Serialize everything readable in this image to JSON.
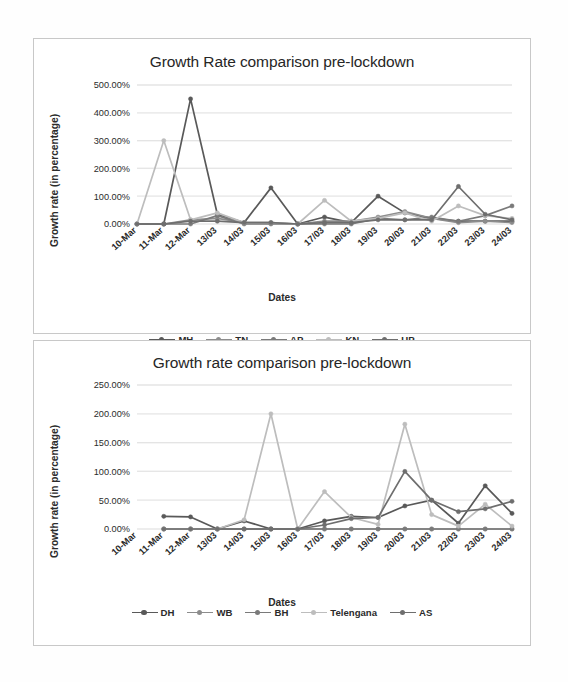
{
  "page": {
    "background": "#fefefe",
    "width": 568,
    "height": 682
  },
  "chart_data": [
    {
      "id": "chart-top",
      "type": "line",
      "title": "Growth Rate comparison pre-lockdown",
      "xlabel": "Dates",
      "ylabel": "Growth rate (in percentage)",
      "categories": [
        "10-Mar",
        "11-Mar",
        "12-Mar",
        "13/03",
        "14/03",
        "15/03",
        "16/03",
        "17/03",
        "18/03",
        "19/03",
        "20/03",
        "21/03",
        "22/03",
        "23/03",
        "24/03"
      ],
      "ylim": [
        0,
        500
      ],
      "yticks": [
        0,
        100,
        200,
        300,
        400,
        500
      ],
      "ytick_labels": [
        "0.00%",
        "100.00%",
        "200.00%",
        "300.00%",
        "400.00%",
        "500.00%"
      ],
      "grid": true,
      "legend_position": "bottom",
      "series": [
        {
          "name": "MH",
          "color": "#595959",
          "values": [
            0,
            0,
            450,
            35,
            5,
            130,
            0,
            25,
            5,
            100,
            40,
            20,
            10,
            10,
            10
          ]
        },
        {
          "name": "TN",
          "color": "#8c8c8c",
          "values": [
            0,
            0,
            15,
            20,
            5,
            5,
            0,
            10,
            10,
            25,
            45,
            20,
            5,
            10,
            5
          ]
        },
        {
          "name": "AP",
          "color": "#7a7a7a",
          "values": [
            0,
            0,
            0,
            30,
            0,
            0,
            0,
            0,
            0,
            20,
            15,
            25,
            10,
            30,
            65
          ]
        },
        {
          "name": "KN",
          "color": "#bdbdbd",
          "values": [
            0,
            300,
            15,
            40,
            5,
            5,
            0,
            85,
            10,
            20,
            40,
            10,
            65,
            30,
            20
          ]
        },
        {
          "name": "UP",
          "color": "#6e6e6e",
          "values": [
            0,
            0,
            10,
            10,
            5,
            5,
            0,
            5,
            5,
            15,
            15,
            15,
            135,
            35,
            15
          ]
        }
      ]
    },
    {
      "id": "chart-bottom",
      "type": "line",
      "title": "Growth rate comparison pre-lockdown",
      "xlabel": "Dates",
      "ylabel": "Growth rate (in percentage)",
      "categories": [
        "10-Mar",
        "11-Mar",
        "12-Mar",
        "13/03",
        "14/03",
        "15/03",
        "16/03",
        "17/03",
        "18/03",
        "19/03",
        "20/03",
        "21/03",
        "22/03",
        "23/03",
        "24/03"
      ],
      "ylim": [
        0,
        250
      ],
      "yticks": [
        0,
        50,
        100,
        150,
        200,
        250
      ],
      "ytick_labels": [
        "0.00%",
        "50.00%",
        "100.00%",
        "150.00%",
        "200.00%",
        "250.00%"
      ],
      "grid": true,
      "legend_position": "bottom",
      "series": [
        {
          "name": "DH",
          "color": "#595959",
          "values": [
            null,
            22,
            21,
            0,
            14,
            0,
            0,
            14,
            22,
            20,
            40,
            50,
            10,
            75,
            27
          ]
        },
        {
          "name": "WB",
          "color": "#8c8c8c",
          "values": [
            null,
            0,
            0,
            0,
            0,
            0,
            0,
            0,
            0,
            0,
            0,
            0,
            0,
            0,
            0
          ]
        },
        {
          "name": "BH",
          "color": "#7a7a7a",
          "values": [
            null,
            0,
            0,
            0,
            0,
            0,
            0,
            0,
            0,
            0,
            0,
            0,
            0,
            0,
            0
          ]
        },
        {
          "name": "Telengana",
          "color": "#bdbdbd",
          "values": [
            null,
            0,
            0,
            0,
            16,
            200,
            0,
            65,
            20,
            8,
            182,
            25,
            5,
            43,
            5
          ]
        },
        {
          "name": "AS",
          "color": "#6e6e6e",
          "values": [
            null,
            0,
            0,
            0,
            0,
            0,
            0,
            7,
            18,
            20,
            100,
            50,
            30,
            35,
            48
          ]
        }
      ]
    }
  ]
}
